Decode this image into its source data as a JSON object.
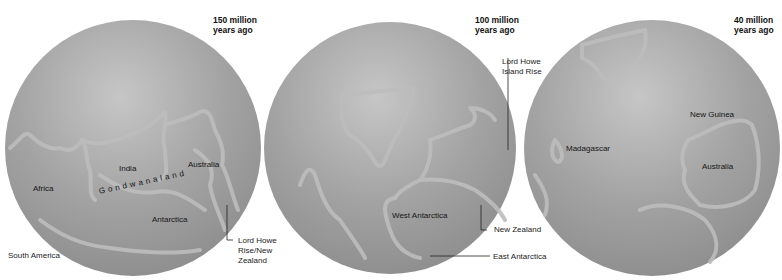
{
  "figure": {
    "panels": [
      {
        "era": [
          "150 million",
          "years ago"
        ],
        "labels": {
          "africa": "Africa",
          "india": "India",
          "australia": "Australia",
          "antarctica": "Antarctica",
          "supercontinent": "Gondwanaland",
          "south_america": "South America"
        },
        "callout": [
          "Lord Howe",
          "Rise/New",
          "Zealand"
        ]
      },
      {
        "era": [
          "100 million",
          "years ago"
        ],
        "labels": {
          "west_antarctica": "West Antarctica"
        },
        "callouts": {
          "lord_howe": [
            "Lord Howe",
            "Island Rise"
          ],
          "new_zealand": "New Zealand",
          "east_antarctica": "East Antarctica"
        }
      },
      {
        "era": [
          "40 million",
          "years ago"
        ],
        "labels": {
          "madagascar": "Madagascar",
          "new_guinea": "New Guinea",
          "australia": "Australia"
        }
      }
    ],
    "colors": {
      "globe": "#9a9a9a",
      "globe_highlight": "#c4c4c4",
      "coast": "#bdbdbd",
      "leader_line": "#222222"
    }
  }
}
